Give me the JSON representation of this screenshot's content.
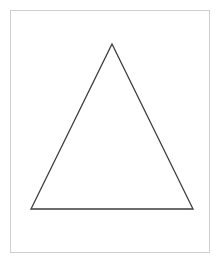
{
  "canvas": {
    "width": 221,
    "height": 262,
    "background_color": "#ffffff"
  },
  "frame": {
    "name": "page-border",
    "x": 10,
    "y": 10,
    "width": 200,
    "height": 243,
    "stroke_color": "#cfcfcf",
    "stroke_width": 1,
    "fill": "none"
  },
  "figure": {
    "label": "triangle",
    "shape_type": "polygon",
    "sides": 3,
    "fill": "none",
    "stroke_color": "#3c3c3c",
    "stroke_width": 1.3,
    "vertices": [
      {
        "name": "apex",
        "x": 112,
        "y": 44
      },
      {
        "name": "bottom-right",
        "x": 193,
        "y": 209
      },
      {
        "name": "bottom-left",
        "x": 31,
        "y": 209
      }
    ],
    "points_attr": "112,44 193,209 31,209",
    "base_length": 162,
    "height": 165
  }
}
